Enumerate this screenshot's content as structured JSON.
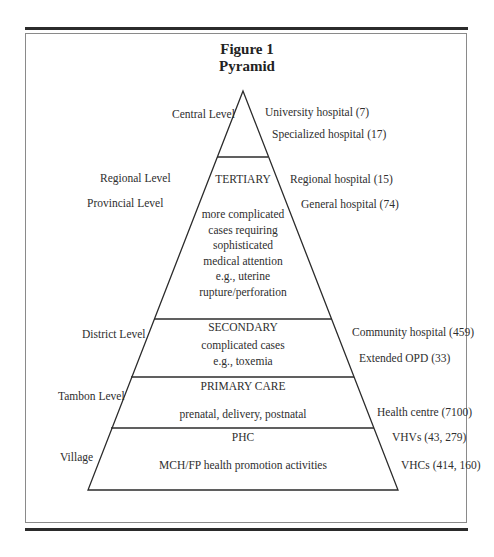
{
  "figure": {
    "title_line1": "Figure 1",
    "title_line2": "Pyramid"
  },
  "left_labels": {
    "central": "Central Level",
    "regional": "Regional Level",
    "provincial": "Provincial Level",
    "district": "District Level",
    "tambon": "Tambon Level",
    "village": "Village"
  },
  "right_labels": {
    "university": "University hospital (7)",
    "specialized": "Specialized hospital (17)",
    "regional_hospital": "Regional hospital (15)",
    "general_hospital": "General hospital (74)",
    "community_hospital": "Community hospital (459)",
    "extended_opd": "Extended OPD (33)",
    "health_centre": "Health centre (7100)",
    "vhvs": "VHVs (43, 279)",
    "vhcs": "VHCs (414, 160)"
  },
  "layers": {
    "tertiary": {
      "title": "TERTIARY",
      "desc": [
        "more complicated",
        "cases requiring",
        "sophisticated",
        "medical attention",
        "e.g., uterine",
        "rupture/perforation"
      ]
    },
    "secondary": {
      "title": "SECONDARY",
      "desc": [
        "complicated cases",
        "e.g., toxemia"
      ]
    },
    "primary": {
      "title": "PRIMARY CARE",
      "desc": [
        "prenatal, delivery, postnatal"
      ]
    },
    "phc": {
      "title": "PHC",
      "desc": [
        "MCH/FP health promotion activities"
      ]
    }
  }
}
